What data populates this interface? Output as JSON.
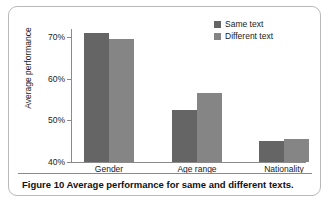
{
  "figure": {
    "caption": "Figure 10 Average performance for same and different texts."
  },
  "chart_data": {
    "type": "bar",
    "title": "",
    "subtitle": "",
    "xlabel": "",
    "ylabel": "Average performance",
    "categories": [
      "Gender",
      "Age range",
      "Nationality"
    ],
    "series": [
      {
        "name": "Same text",
        "color": "#656565",
        "values": [
          71.0,
          52.5,
          45.0
        ]
      },
      {
        "name": "Different text",
        "color": "#858585",
        "values": [
          69.7,
          56.5,
          45.5
        ]
      }
    ],
    "ylim": [
      40,
      72
    ],
    "yticks": [
      40,
      50,
      60,
      70
    ],
    "ytick_labels": [
      "40%",
      "50%",
      "60%",
      "70%"
    ],
    "grid": false,
    "legend_position": "top-right",
    "value_suffix": "%"
  },
  "colors": {
    "series_same": "#656565",
    "series_different": "#858585",
    "axis": "#8a8a8a",
    "border": "#b9b9b9",
    "text": "#1a1a1a",
    "background": "#ffffff"
  }
}
